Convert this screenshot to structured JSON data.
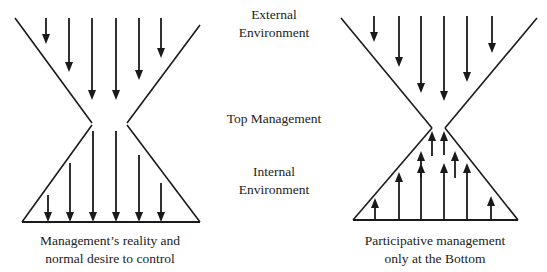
{
  "labels": {
    "external": [
      "External",
      "Environment"
    ],
    "top": "Top Management",
    "internal": [
      "Internal",
      "Environment"
    ]
  },
  "captions": {
    "left": [
      "Management’s reality and",
      "normal desire to control"
    ],
    "right": [
      "Participative management",
      "only at the Bottom"
    ]
  },
  "colors": {
    "stroke": "#1a1a1a",
    "background": "#ffffff"
  },
  "figures": [
    {
      "name": "left-hourglass",
      "outline": {
        "top_left": [
          [
            15,
            18
          ],
          [
            92,
            123
          ]
        ],
        "top_right": [
          [
            200,
            25
          ],
          [
            127,
            123
          ]
        ],
        "bottom_left": [
          [
            92,
            125
          ],
          [
            22,
            222
          ]
        ],
        "bottom_right": [
          [
            127,
            125
          ],
          [
            200,
            222
          ]
        ],
        "base": [
          [
            22,
            222
          ],
          [
            200,
            222
          ]
        ]
      },
      "arrows": [
        {
          "x": 46,
          "y1": 18,
          "y2": 44,
          "dir": "down"
        },
        {
          "x": 69,
          "y1": 18,
          "y2": 72,
          "dir": "down"
        },
        {
          "x": 92,
          "y1": 18,
          "y2": 100,
          "dir": "down"
        },
        {
          "x": 116,
          "y1": 18,
          "y2": 100,
          "dir": "down"
        },
        {
          "x": 139,
          "y1": 18,
          "y2": 80,
          "dir": "down"
        },
        {
          "x": 161,
          "y1": 18,
          "y2": 58,
          "dir": "down"
        },
        {
          "x": 48,
          "y1": 195,
          "y2": 222,
          "dir": "down"
        },
        {
          "x": 70,
          "y1": 163,
          "y2": 222,
          "dir": "down"
        },
        {
          "x": 93,
          "y1": 131,
          "y2": 222,
          "dir": "down"
        },
        {
          "x": 116,
          "y1": 131,
          "y2": 222,
          "dir": "down"
        },
        {
          "x": 139,
          "y1": 155,
          "y2": 222,
          "dir": "down"
        },
        {
          "x": 161,
          "y1": 183,
          "y2": 222,
          "dir": "down"
        }
      ]
    },
    {
      "name": "right-hourglass",
      "outline": {
        "top_left": [
          [
            341,
            18
          ],
          [
            432,
            128
          ]
        ],
        "top_right": [
          [
            537,
            18
          ],
          [
            445,
            128
          ]
        ],
        "bottom_left": [
          [
            432,
            128
          ],
          [
            353,
            220
          ]
        ],
        "bottom_right": [
          [
            445,
            128
          ],
          [
            518,
            220
          ]
        ],
        "base": [
          [
            353,
            220
          ],
          [
            518,
            220
          ]
        ]
      },
      "arrows": [
        {
          "x": 374,
          "y1": 16,
          "y2": 42,
          "dir": "down"
        },
        {
          "x": 399,
          "y1": 16,
          "y2": 67,
          "dir": "down"
        },
        {
          "x": 421,
          "y1": 16,
          "y2": 93,
          "dir": "down"
        },
        {
          "x": 444,
          "y1": 16,
          "y2": 101,
          "dir": "down"
        },
        {
          "x": 467,
          "y1": 16,
          "y2": 82,
          "dir": "down"
        },
        {
          "x": 492,
          "y1": 16,
          "y2": 53,
          "dir": "down"
        },
        {
          "x": 375,
          "y1": 220,
          "y2": 198,
          "dir": "up"
        },
        {
          "x": 399,
          "y1": 220,
          "y2": 172,
          "dir": "up"
        },
        {
          "x": 421,
          "y1": 220,
          "y2": 163,
          "dir": "up"
        },
        {
          "x": 444,
          "y1": 220,
          "y2": 163,
          "dir": "up"
        },
        {
          "x": 467,
          "y1": 220,
          "y2": 163,
          "dir": "up"
        },
        {
          "x": 491,
          "y1": 220,
          "y2": 196,
          "dir": "up"
        },
        {
          "x": 421,
          "y1": 178,
          "y2": 151,
          "dir": "up"
        },
        {
          "x": 432,
          "y1": 156,
          "y2": 131,
          "dir": "up"
        },
        {
          "x": 444,
          "y1": 155,
          "y2": 131,
          "dir": "up"
        },
        {
          "x": 455,
          "y1": 178,
          "y2": 151,
          "dir": "up"
        }
      ]
    }
  ]
}
